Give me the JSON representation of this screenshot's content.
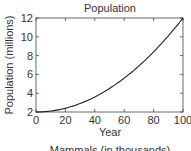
{
  "chart_data": {
    "type": "line",
    "title": "Population",
    "xlabel": "Year",
    "ylabel": "Population (millions)",
    "footer": "Mammals (in thousands)",
    "xlim": [
      0,
      100
    ],
    "ylim": [
      2,
      12
    ],
    "xticks": [
      0,
      20,
      40,
      60,
      80,
      100
    ],
    "yticks": [
      2,
      4,
      6,
      8,
      10,
      12
    ],
    "grid": false,
    "legend": null,
    "series": [
      {
        "name": "Population",
        "color": "#222222",
        "x": [
          0,
          10,
          20,
          30,
          40,
          50,
          60,
          70,
          80,
          90,
          100
        ],
        "y": [
          2.0,
          2.1,
          2.4,
          2.9,
          3.6,
          4.5,
          5.6,
          6.9,
          8.4,
          10.1,
          12.0
        ]
      }
    ]
  }
}
